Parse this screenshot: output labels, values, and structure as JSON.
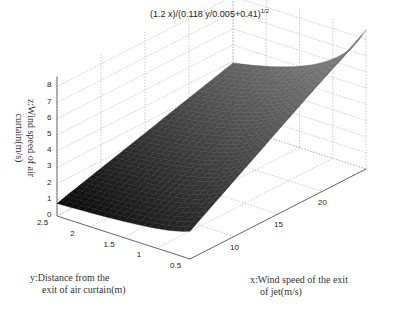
{
  "chart_data": {
    "type": "surface",
    "title_base": "(1.2 x)/(0.118 y/0.005+0.41)",
    "title_exp": "1/2",
    "xlabel": "x:Wind speed of the exit of jet(m/s)",
    "xlabel_line1": "x:Wind speed of the exit",
    "xlabel_line2": "of jet(m/s)",
    "ylabel": "y:Distance from the exit of air curtain(m)",
    "ylabel_line1": "y:Distance from the",
    "ylabel_line2": "exit of air curtain(m)",
    "zlabel": "z:Wind speed of air curtain(m/s)",
    "zlabel_line1": "z:Wind speed of air",
    "zlabel_line2": "curtain(m/s)",
    "x_ticks": [
      "10",
      "15",
      "20"
    ],
    "y_ticks": [
      "2.5",
      "2",
      "1.5",
      "1",
      "0.5"
    ],
    "z_ticks": [
      "0",
      "1",
      "2",
      "3",
      "4",
      "5",
      "6",
      "7",
      "8"
    ],
    "xlim": [
      5,
      25
    ],
    "ylim": [
      0.5,
      2.5
    ],
    "zlim": [
      0,
      8
    ],
    "grid": true,
    "corner_values": [
      {
        "x": 5,
        "y": 2.5,
        "z": 1.0
      },
      {
        "x": 5,
        "y": 0.5,
        "z": 1.6
      },
      {
        "x": 25,
        "y": 2.5,
        "z": 5.5
      },
      {
        "x": 25,
        "y": 0.5,
        "z": 7.1
      }
    ]
  }
}
